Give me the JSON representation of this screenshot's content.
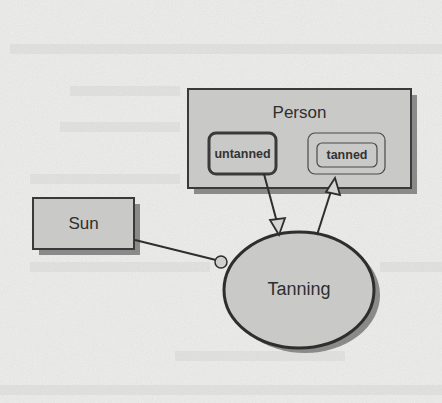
{
  "diagram": {
    "type": "OPM object-process diagram",
    "colors": {
      "background": "#efefed",
      "fill": "#c9c9c7",
      "stroke": "#3a3a3a",
      "shadow": "#8a8a8a",
      "text": "#2f2f2f"
    },
    "objects": [
      {
        "id": "person",
        "label": "Person",
        "shape": "rectangle",
        "states": [
          {
            "id": "untanned",
            "label": "untanned",
            "initial": true
          },
          {
            "id": "tanned",
            "label": "tanned",
            "final": true
          }
        ]
      },
      {
        "id": "sun",
        "label": "Sun",
        "shape": "rectangle"
      }
    ],
    "processes": [
      {
        "id": "tanning",
        "label": "Tanning",
        "shape": "ellipse"
      }
    ],
    "links": [
      {
        "from": "untanned",
        "to": "tanning",
        "type": "consumption",
        "head": "open-triangle"
      },
      {
        "from": "tanning",
        "to": "tanned",
        "type": "result",
        "head": "open-triangle"
      },
      {
        "from": "sun",
        "to": "tanning",
        "type": "instrument",
        "head": "hollow-circle"
      }
    ]
  }
}
